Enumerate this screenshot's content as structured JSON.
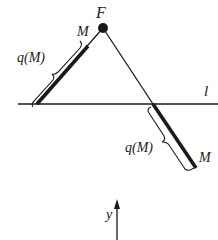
{
  "diagram": {
    "labels": {
      "focus": "F",
      "line": "l",
      "point_left": "M",
      "point_right": "M",
      "length_left": "q(M)",
      "length_right": "q(M)",
      "axis": "y"
    },
    "colors": {
      "ink": "#1a1a1a",
      "background": "#ffffff"
    }
  }
}
